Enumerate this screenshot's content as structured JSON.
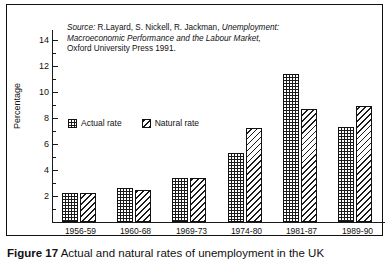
{
  "figure": {
    "caption_number": "Figure 17",
    "caption_text": "Actual and natural rates of unemployment in the UK"
  },
  "source_note": {
    "label": "Source:",
    "authors": " R.Layard, S. Nickell, R. Jackman, ",
    "title_line1": "Unemployment:",
    "title_line2": "Macroeconomic Performance and the Labour Market,",
    "publisher_line": "Oxford University Press 1991."
  },
  "legend": {
    "items": [
      {
        "label": "Actual rate",
        "pattern": "dotted-dark",
        "swatch_name": "legend-swatch-actual"
      },
      {
        "label": "Natural rate",
        "pattern": "diagonal-hatch",
        "swatch_name": "legend-swatch-natural"
      }
    ]
  },
  "chart_data": {
    "type": "bar",
    "title": "Actual and natural rates of unemployment in the UK",
    "xlabel": "",
    "ylabel": "Percentage",
    "ylim": [
      0,
      14
    ],
    "ytick_major": [
      0,
      2,
      4,
      6,
      8,
      10,
      12,
      14
    ],
    "ytick_minor": [
      1,
      3,
      5,
      7,
      9,
      11,
      13
    ],
    "ytick_labels": [
      "0",
      "2",
      "4",
      "6",
      "8",
      "10",
      "12",
      "14"
    ],
    "grid": false,
    "legend_position": "inside-upper-left",
    "categories": [
      "1956-59",
      "1960-68",
      "1969-73",
      "1974-80",
      "1981-87",
      "1989-90"
    ],
    "series": [
      {
        "name": "Actual rate",
        "values": [
          2.2,
          2.6,
          3.4,
          5.3,
          11.4,
          7.3
        ]
      },
      {
        "name": "Natural rate",
        "values": [
          2.2,
          2.5,
          3.4,
          7.2,
          8.7,
          8.9
        ]
      }
    ],
    "colors": {
      "actual": "#1b1b1b",
      "natural": "#ffffff",
      "outline": "#111111"
    }
  }
}
